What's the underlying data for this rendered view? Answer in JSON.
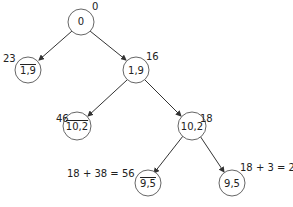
{
  "diagram": {
    "type": "branch-and-bound tree",
    "nodes": [
      {
        "id": "root",
        "text": "0",
        "negated": false,
        "cost": "0"
      },
      {
        "id": "n1bar9",
        "text": "1,9",
        "negated": true,
        "cost": "23"
      },
      {
        "id": "n19",
        "text": "1,9",
        "negated": false,
        "cost": "16"
      },
      {
        "id": "n10bar2",
        "text": "10,2",
        "negated": true,
        "cost": "46"
      },
      {
        "id": "n102",
        "text": "10,2",
        "negated": false,
        "cost": "18"
      },
      {
        "id": "n9bar5",
        "text": "9,5",
        "negated": true,
        "cost": "18 + 38 = 56"
      },
      {
        "id": "n95",
        "text": "9,5",
        "negated": false,
        "cost": "18 + 3 = 21"
      }
    ],
    "edges": [
      {
        "from": "root",
        "to": "n1bar9"
      },
      {
        "from": "root",
        "to": "n19"
      },
      {
        "from": "n19",
        "to": "n10bar2"
      },
      {
        "from": "n19",
        "to": "n102"
      },
      {
        "from": "n102",
        "to": "n9bar5"
      },
      {
        "from": "n102",
        "to": "n95"
      }
    ]
  }
}
